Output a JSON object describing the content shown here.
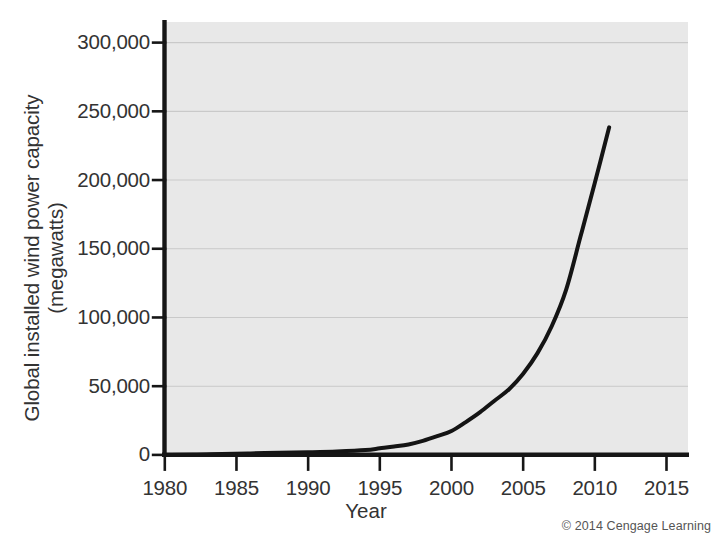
{
  "chart_data": {
    "type": "line",
    "title": "",
    "xlabel": "Year",
    "ylabel_line1": "Global installed wind power capacity",
    "ylabel_line2": "(megawatts)",
    "ylabel": "Global installed wind power capacity (megawatts)",
    "xlim": [
      1980,
      2016.5
    ],
    "ylim": [
      0,
      315000
    ],
    "xticks": [
      1980,
      1985,
      1990,
      1995,
      2000,
      2005,
      2010,
      2015
    ],
    "xtick_labels": [
      "1980",
      "1985",
      "1990",
      "1995",
      "2000",
      "2005",
      "2010",
      "2015"
    ],
    "yticks": [
      0,
      50000,
      100000,
      150000,
      200000,
      250000,
      300000
    ],
    "ytick_labels": [
      "0",
      "50,000",
      "100,000",
      "150,000",
      "200,000",
      "250,000",
      "300,000"
    ],
    "grid": "horizontal",
    "legend": "none",
    "series": [
      {
        "name": "Global installed wind power capacity",
        "color": "#141414",
        "line_width": 4,
        "x": [
          1980,
          1982,
          1984,
          1986,
          1988,
          1990,
          1992,
          1994,
          1995,
          1996,
          1997,
          1998,
          1999,
          2000,
          2001,
          2002,
          2003,
          2004,
          2005,
          2006,
          2007,
          2008,
          2009,
          2010,
          2011
        ],
        "values": [
          10,
          90,
          600,
          1100,
          1500,
          1930,
          2500,
          3500,
          4800,
          6100,
          7600,
          10200,
          13600,
          17400,
          23900,
          31100,
          39431,
          47620,
          59091,
          74052,
          93820,
          120291,
          158864,
          197956,
          238351
        ]
      }
    ],
    "annotations": [],
    "credit": "© 2014 Cengage Learning",
    "plot_background": "#e8e8e8",
    "page_background": "#ffffff",
    "axis_color": "#161616",
    "gridline_color": "#c9c9c9",
    "text_color": "#333333"
  },
  "axes": {
    "y_title_line1": "Global installed wind power capacity",
    "y_title_line2": "(megawatts)",
    "x_title": "Year"
  },
  "footer": {
    "credit": "© 2014 Cengage Learning"
  }
}
